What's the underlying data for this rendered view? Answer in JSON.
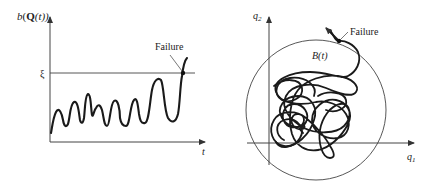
{
  "left_panel": {
    "y_axis_label_prefix": "b",
    "y_axis_label_open": "(",
    "y_axis_label_bold": "Q",
    "y_axis_label_inner": "(t))",
    "x_axis_label": "t",
    "threshold_label": "ξ",
    "failure_label": "Failure"
  },
  "right_panel": {
    "x_axis_label_base": "q",
    "x_axis_label_sub": "1",
    "y_axis_label_base": "q",
    "y_axis_label_sub": "2",
    "region_label": "B(t)",
    "failure_label": "Failure"
  },
  "colors": {
    "line": "#1a1a1a",
    "axis": "#444444",
    "thin": "#555555"
  }
}
